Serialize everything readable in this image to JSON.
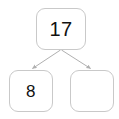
{
  "diagram": {
    "type": "number-bond",
    "title": "",
    "colors": {
      "background": "#ffffff",
      "node_fill": "#ffffff",
      "node_border": "#c9c9c9",
      "text": "#111111",
      "connector": "#b0b0b0"
    },
    "nodes": [
      {
        "id": "parent",
        "role": "whole",
        "value": "17",
        "empty": false
      },
      {
        "id": "child-left",
        "role": "part",
        "value": "8",
        "empty": false
      },
      {
        "id": "child-right",
        "role": "part",
        "value": "",
        "empty": true
      }
    ],
    "connectors": [
      {
        "id": "parent-to-left",
        "from": "parent",
        "to": "child-left",
        "arrowhead": "triangle"
      },
      {
        "id": "parent-to-right",
        "from": "parent",
        "to": "child-right",
        "arrowhead": "triangle"
      }
    ]
  }
}
